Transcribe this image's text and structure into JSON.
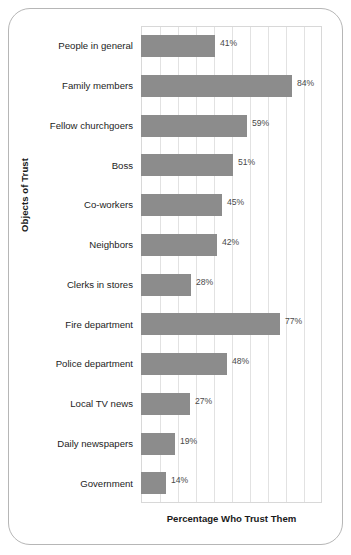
{
  "chart_data": {
    "type": "bar",
    "orientation": "horizontal",
    "title": "",
    "xlabel": "Percentage Who Trust Them",
    "ylabel": "Objects of Trust",
    "categories": [
      "People in general",
      "Family members",
      "Fellow churchgoers",
      "Boss",
      "Co-workers",
      "Neighbors",
      "Clerks in stores",
      "Fire department",
      "Police department",
      "Local TV news",
      "Daily newspapers",
      "Government"
    ],
    "values": [
      41,
      84,
      59,
      51,
      45,
      42,
      28,
      77,
      48,
      27,
      19,
      14
    ],
    "value_labels": [
      "41%",
      "84%",
      "59%",
      "51%",
      "45%",
      "42%",
      "28%",
      "77%",
      "48%",
      "27%",
      "19%",
      "14%"
    ],
    "xlim": [
      0,
      100
    ],
    "xticks": [
      0,
      10,
      20,
      30,
      40,
      50,
      60,
      70,
      80,
      90,
      100
    ],
    "xtick_labels": [
      "",
      "",
      "",
      "",
      "",
      "",
      "",
      "",
      "",
      "",
      ""
    ],
    "grid": "vertical",
    "legend": "none",
    "bar_color": "#8c8c8c",
    "gridline_color": "#e2e2e2",
    "plot_border_color": "#d8d8d8",
    "frame_border_color": "#b6b6b6",
    "background_color": "#ffffff"
  },
  "axes": {
    "y_title": "Objects of Trust",
    "x_title": "Percentage Who Trust Them"
  }
}
